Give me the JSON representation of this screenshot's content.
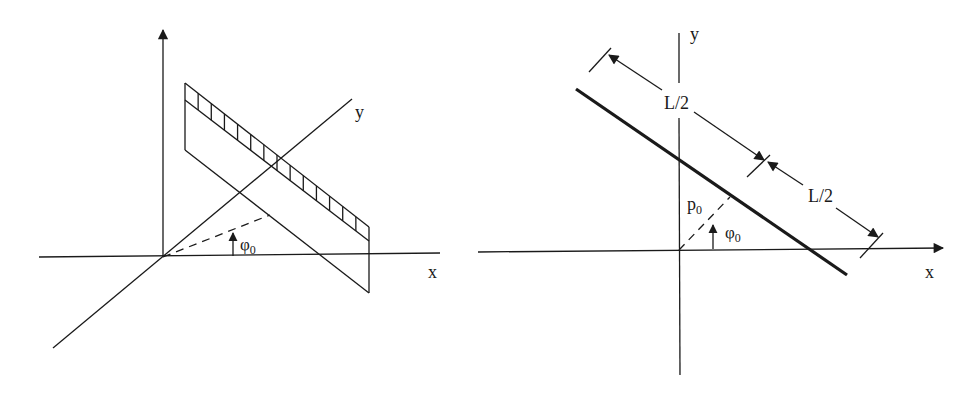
{
  "figure": {
    "left_panel": {
      "description": "3D view of a strip projection plane with detector cells at angle phi0",
      "axis_x_label": "x",
      "axis_y_label": "y",
      "angle_label": "φ",
      "angle_subscript": "0",
      "detector_cells": 14
    },
    "right_panel": {
      "description": "2D line at distance p0 and angle phi0 with length L split into halves",
      "axis_x_label": "x",
      "axis_y_label": "y",
      "half_length_label_top": "L/2",
      "half_length_label_bottom": "L/2",
      "distance_label": "p",
      "distance_subscript": "0",
      "angle_label": "φ",
      "angle_subscript": "0"
    },
    "colors": {
      "line": "#1a1a1a",
      "background": "#ffffff"
    }
  }
}
